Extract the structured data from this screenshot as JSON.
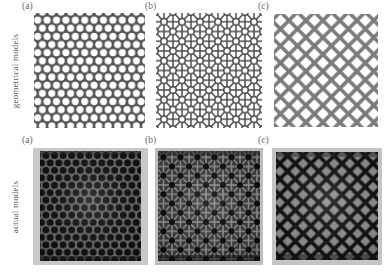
{
  "figure": {
    "type": "two-row-three-column-panel-figure",
    "background": "#ffffff",
    "rows": [
      {
        "id": "geometrical",
        "label": "geometrical models",
        "label_color": "#585858",
        "panels": [
          {
            "id": "geo-a",
            "caption": "(a)",
            "pattern": "hexagonal-circular-holes",
            "description": "Close-packed circular holes arranged in a hexagonal (honeycomb) lattice.",
            "ligament_color": "#555555",
            "void_color": "#ffffff"
          },
          {
            "id": "geo-b",
            "caption": "(b)",
            "pattern": "mixed-circle-triangle-square-lattice",
            "description": "Hybrid lattice combining circular voids with triangular and rectangular cells.",
            "ligament_color": "#4d4d4d",
            "void_color": "#ffffff"
          },
          {
            "id": "geo-c",
            "caption": "(c)",
            "pattern": "diagonal-cross-star-lattice",
            "description": "Sparse diagonal lattice of plus/cross shaped struts on a 45 degree grid.",
            "ligament_color": "#7a7a7a",
            "void_color": "#ffffff"
          }
        ]
      },
      {
        "id": "actual",
        "label": "actual models",
        "label_color": "#585858",
        "panels": [
          {
            "id": "photo-a",
            "caption": "(a)",
            "pattern": "hexagonal-circular-holes",
            "description": "Photograph of fabricated specimen with hexagonally packed circular channels.",
            "background_color": "#c8c8c8",
            "strut_color": "#1c1c1c"
          },
          {
            "id": "photo-b",
            "caption": "(b)",
            "pattern": "mixed-circle-triangle-square-lattice",
            "description": "Photograph of fabricated hybrid lattice specimen.",
            "background_color": "#bdbdbd",
            "strut_color": "#151515"
          },
          {
            "id": "photo-c",
            "caption": "(c)",
            "pattern": "diagonal-cross-star-lattice",
            "description": "Photograph of fabricated diagonal cross lattice specimen.",
            "background_color": "#c4c4c4",
            "strut_color": "#1a1a1a"
          }
        ]
      }
    ]
  }
}
